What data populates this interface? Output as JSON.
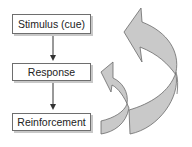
{
  "diagram": {
    "nodes": [
      {
        "id": "stimulus",
        "label": "Stimulus (cue)"
      },
      {
        "id": "response",
        "label": "Response"
      },
      {
        "id": "reinforcement",
        "label": "Reinforcement"
      }
    ],
    "edges": [
      {
        "from": "stimulus",
        "to": "response",
        "style": "straight-arrow"
      },
      {
        "from": "response",
        "to": "reinforcement",
        "style": "straight-arrow"
      },
      {
        "from": "reinforcement",
        "to": "response",
        "style": "curved-ribbon-arrow"
      },
      {
        "from": "reinforcement",
        "to": "stimulus",
        "style": "curved-ribbon-arrow"
      }
    ],
    "colors": {
      "box_border": "#6e6e6e",
      "box_shadow": "#c8c8c8",
      "ribbon_fill": "#c9c9c9",
      "ribbon_stroke": "#6a6a6a",
      "connector": "#333333"
    }
  }
}
